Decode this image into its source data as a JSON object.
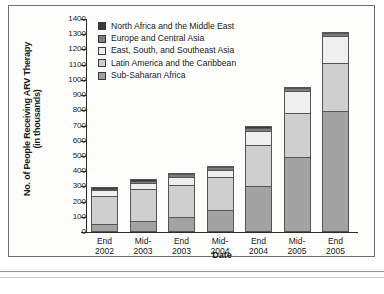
{
  "chart_data": {
    "type": "bar",
    "stacked": true,
    "title": "",
    "xlabel": "Date",
    "ylabel": "No. of People Receiving ARV Therapy (in thousands)",
    "ylabel_line1": "No. of People Receiving ARV Therapy",
    "ylabel_line2": "(in thousands)",
    "categories": [
      "End 2002",
      "Mid-2003",
      "End 2003",
      "Mid-2004",
      "End 2004",
      "Mid-2005",
      "End 2005"
    ],
    "category_lines": [
      [
        "End",
        "2002"
      ],
      [
        "Mid-",
        "2003"
      ],
      [
        "End",
        "2003"
      ],
      [
        "Mid-",
        "2004"
      ],
      [
        "End",
        "2004"
      ],
      [
        "Mid-",
        "2005"
      ],
      [
        "End",
        "2005"
      ]
    ],
    "ylim": [
      0,
      1400
    ],
    "ytick_step": 100,
    "yticks": [
      0,
      100,
      200,
      300,
      400,
      500,
      600,
      700,
      800,
      900,
      1000,
      1100,
      1200,
      1300,
      1400
    ],
    "grid": false,
    "legend_position": "upper-left-inside",
    "series": [
      {
        "name": "North Africa and the Middle East",
        "color": "#3a3a3a",
        "values": [
          5,
          8,
          10,
          10,
          10,
          10,
          10
        ]
      },
      {
        "name": "Europe and Central Asia",
        "color": "#7d7d7d",
        "values": [
          10,
          12,
          15,
          15,
          20,
          20,
          15
        ]
      },
      {
        "name": "East, South, and Southeast Asia",
        "color": "#efefef",
        "values": [
          35,
          45,
          55,
          50,
          90,
          145,
          180
        ]
      },
      {
        "name": "Latin America and the Caribbean",
        "color": "#cfcfcf",
        "values": [
          190,
          210,
          210,
          215,
          275,
          290,
          315
        ]
      },
      {
        "name": "Sub-Saharan Africa",
        "color": "#a3a3a3",
        "values": [
          50,
          70,
          100,
          145,
          300,
          490,
          795
        ]
      }
    ],
    "totals": [
      290,
      345,
      390,
      435,
      695,
      955,
      1315
    ]
  }
}
